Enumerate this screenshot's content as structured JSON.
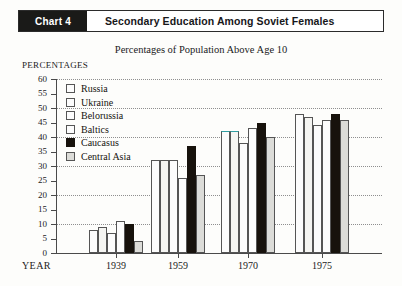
{
  "header": {
    "tag": "Chart 4",
    "title": "Secondary Education Among Soviet Females"
  },
  "subtitle": "Percentages of Population Above Age 10",
  "axis_caption": "PERCENTAGES",
  "year_caption": "YEAR",
  "legend": [
    {
      "label": "Russia",
      "fill": "#fcfcfc"
    },
    {
      "label": "Ukraine",
      "fill": "#fcfcfc"
    },
    {
      "label": "Belorussia",
      "fill": "#fcfcfc"
    },
    {
      "label": "Baltics",
      "fill": "#fcfcfc"
    },
    {
      "label": "Caucasus",
      "fill": "#17120c"
    },
    {
      "label": "Central Asia",
      "fill": "#dcdcd8"
    }
  ],
  "chart_data": {
    "type": "bar",
    "title": "Secondary Education Among Soviet Females",
    "subtitle": "Percentages of Population Above Age 10",
    "xlabel": "YEAR",
    "ylabel": "PERCENTAGES",
    "ylim": [
      0,
      60
    ],
    "ytick_step": 5,
    "yticks": [
      0,
      5,
      10,
      15,
      20,
      25,
      30,
      35,
      40,
      45,
      50,
      55,
      60
    ],
    "grid": true,
    "grid_step": 10,
    "legend_position": "upper-left-inside",
    "categories": [
      "1939",
      "1959",
      "1970",
      "1975"
    ],
    "series": [
      {
        "name": "Russia",
        "values": [
          8,
          32,
          42,
          48
        ]
      },
      {
        "name": "Ukraine",
        "values": [
          9,
          32,
          42,
          47
        ]
      },
      {
        "name": "Belorussia",
        "values": [
          7,
          32,
          38,
          44
        ]
      },
      {
        "name": "Baltics",
        "values": [
          11,
          26,
          43,
          46
        ]
      },
      {
        "name": "Caucasus",
        "values": [
          10,
          37,
          45,
          48
        ]
      },
      {
        "name": "Central Asia",
        "values": [
          4,
          27,
          40,
          46
        ]
      }
    ]
  }
}
